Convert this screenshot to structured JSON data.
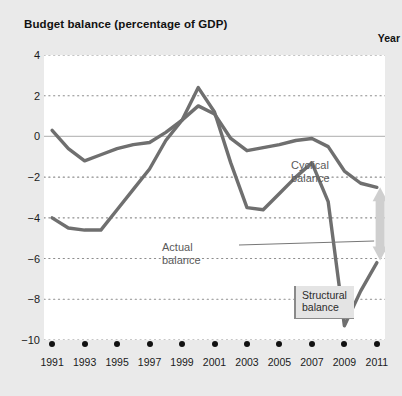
{
  "chart": {
    "title": "Budget balance (percentage of GDP)",
    "xlabel": "Year"
  },
  "annotations": {
    "cyclical_line1": "Cyclical",
    "cyclical_line2": "balance",
    "actual_line1": "Actual",
    "actual_line2": "balance",
    "structural_line1": "Structural",
    "structural_line2": "balance"
  },
  "colors": {
    "series_line": "#6f6f6f",
    "zero_line": "#bdbdbd",
    "gridline": "#8d8d8d",
    "arrow": "#cfcfcf",
    "figure_background": "#eaeaea",
    "plot_background": "#ffffff",
    "text": "#1a1a1a",
    "annotation_text": "#5a5a5a",
    "structural_box": "#e4e4e4"
  },
  "chart_data": {
    "type": "line",
    "title": "Budget balance (percentage of GDP)",
    "xlabel": "Year",
    "ylabel": "",
    "xlim": [
      1990.5,
      2011.5
    ],
    "ylim": [
      -10,
      4
    ],
    "yticks": [
      4,
      2,
      0,
      -2,
      -4,
      -6,
      -8,
      -10
    ],
    "ytick_labels": [
      "4",
      "2",
      "0",
      "−2",
      "−4",
      "−6",
      "−8",
      "−10"
    ],
    "xticks": [
      1991,
      1993,
      1995,
      1997,
      1999,
      2001,
      2003,
      2005,
      2007,
      2009,
      2011
    ],
    "xtick_labels": [
      "1991",
      "1993",
      "1995",
      "1997",
      "1999",
      "2001",
      "2003",
      "2005",
      "2007",
      "2009",
      "2011"
    ],
    "grid": "horizontal-dotted",
    "zero_line": true,
    "legend": "inline-annotations",
    "x": [
      1991,
      1992,
      1993,
      1994,
      1995,
      1996,
      1997,
      1998,
      1999,
      2000,
      2001,
      2002,
      2003,
      2004,
      2005,
      2006,
      2007,
      2008,
      2009,
      2010,
      2011
    ],
    "series": [
      {
        "name": "Actual balance",
        "values": [
          -4.0,
          -4.5,
          -4.6,
          -4.6,
          -3.6,
          -2.6,
          -1.6,
          -0.2,
          0.8,
          2.4,
          1.2,
          -1.3,
          -3.5,
          -3.6,
          -2.8,
          -2.0,
          -1.3,
          -3.2,
          -9.3,
          -7.6,
          -6.2
        ]
      },
      {
        "name": "Cyclical balance",
        "values": [
          0.3,
          -0.6,
          -1.2,
          -0.9,
          -0.6,
          -0.4,
          -0.3,
          0.2,
          0.8,
          1.5,
          1.1,
          -0.1,
          -0.7,
          -0.55,
          -0.4,
          -0.2,
          -0.1,
          -0.5,
          -1.7,
          -2.3,
          -2.5
        ]
      }
    ],
    "annotations": [
      {
        "text": "Cyclical balance",
        "x": 2005.5,
        "y": 0.5
      },
      {
        "text": "Actual balance",
        "x": 1996.0,
        "y": -2.4
      },
      {
        "text": "Structural balance",
        "x": 2005.8,
        "y": -4.7,
        "boxed": true
      }
    ],
    "arrow": {
      "type": "double-headed-vertical",
      "x": 2011.2,
      "y_top": -2.5,
      "y_bottom": -6.1,
      "meaning": "gap between actual and structural balance"
    }
  }
}
